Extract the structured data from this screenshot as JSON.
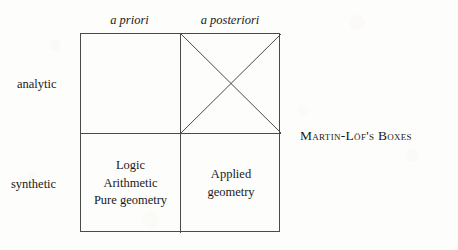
{
  "figure": {
    "caption": "Martin-Löf's Boxes",
    "column_headers": [
      {
        "key": "a_priori",
        "label": "a priori"
      },
      {
        "key": "a_posteriori",
        "label": "a posteriori"
      }
    ],
    "row_labels": [
      {
        "key": "analytic",
        "label": "analytic"
      },
      {
        "key": "synthetic",
        "label": "synthetic"
      }
    ],
    "cells": [
      {
        "row": "analytic",
        "column": "a priori",
        "lines": [],
        "crossed_out": false
      },
      {
        "row": "analytic",
        "column": "a posteriori",
        "lines": [],
        "crossed_out": true
      },
      {
        "row": "synthetic",
        "column": "a priori",
        "lines": [
          "Logic",
          "Arithmetic",
          "Pure geometry"
        ],
        "crossed_out": false
      },
      {
        "row": "synthetic",
        "column": "a posteriori",
        "lines": [
          "Applied",
          "geometry"
        ],
        "crossed_out": false
      }
    ],
    "cell_text": {
      "synthetic_apriori_line1": "Logic",
      "synthetic_apriori_line2": "Arithmetic",
      "synthetic_apriori_line3": "Pure geometry",
      "synthetic_aposteriori_line1": "Applied",
      "synthetic_aposteriori_line2": "geometry"
    }
  },
  "colors": {
    "background": "#fdfdfb",
    "ink": "#1a1a1a",
    "rule": "#4a4a4a"
  }
}
